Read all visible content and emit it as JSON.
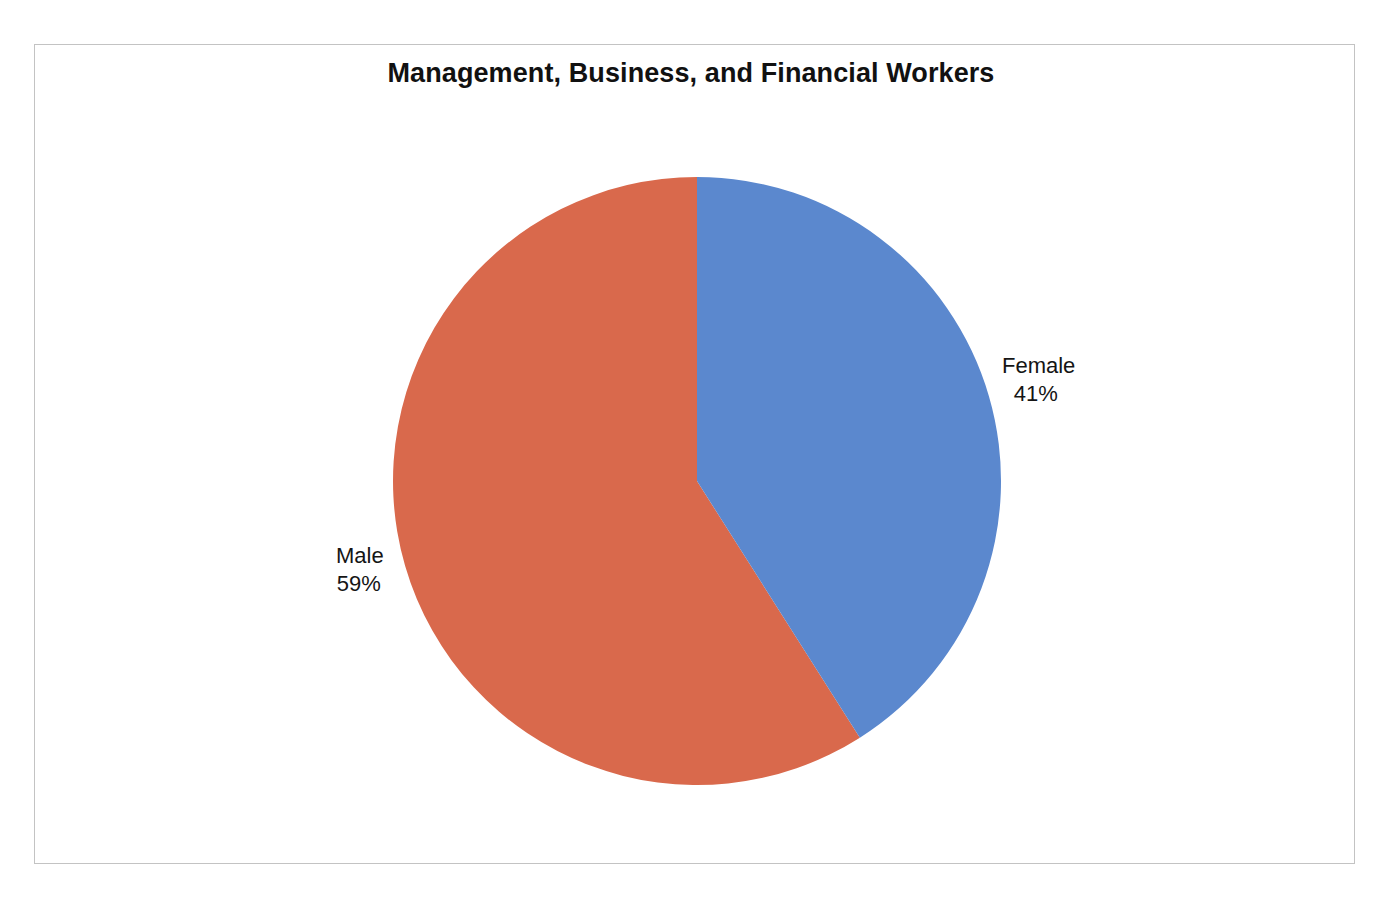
{
  "chart_data": {
    "type": "pie",
    "title": "Management, Business, and Financial Workers",
    "categories": [
      "Female",
      "Male"
    ],
    "values": [
      41,
      59
    ],
    "value_unit": "%",
    "labels": [
      {
        "name": "Female",
        "value": "41%",
        "percent": 41,
        "color": "#5b88ce",
        "position": "right"
      },
      {
        "name": "Male",
        "value": "59%",
        "percent": 59,
        "color": "#d9694c",
        "position": "left"
      }
    ],
    "legend": "none",
    "grid": false,
    "start_angle_deg": 0,
    "direction": "clockwise",
    "xlabel": "",
    "ylabel": ""
  },
  "figure": {
    "background": "#ffffff",
    "frame_color": "#c3c3c3",
    "pie": {
      "center_x": 697,
      "center_y": 481,
      "radius": 304
    }
  }
}
